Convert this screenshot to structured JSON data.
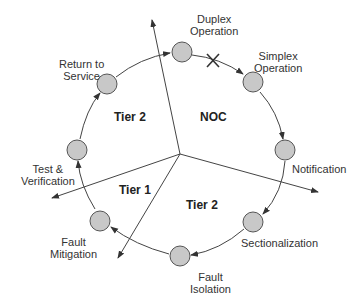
{
  "diagram": {
    "nodes": [
      {
        "id": "duplex",
        "label": "Duplex\nOperation"
      },
      {
        "id": "simplex",
        "label": "Simplex\nOperation"
      },
      {
        "id": "notification",
        "label": "Notification"
      },
      {
        "id": "sectionalization",
        "label": "Sectionalization"
      },
      {
        "id": "fault-isolation",
        "label": "Fault\nIsolation"
      },
      {
        "id": "fault-mitigation",
        "label": "Fault\nMitigation"
      },
      {
        "id": "test-verification",
        "label": "Test &\nVerification"
      },
      {
        "id": "return-to-service",
        "label": "Return to\nService"
      }
    ],
    "regions": {
      "noc": "NOC",
      "tier2_top": "Tier 2",
      "tier1": "Tier 1",
      "tier2_bottom": "Tier 2"
    },
    "colors": {
      "node_fill": "#c8c8c8",
      "stroke": "#444444"
    }
  }
}
